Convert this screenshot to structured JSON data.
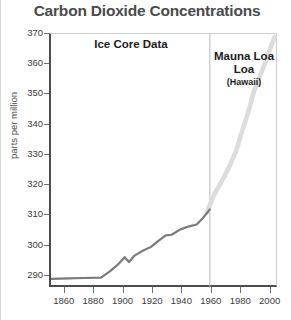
{
  "chart_data": {
    "type": "line",
    "title": "Carbon Dioxide Concentrations",
    "xlabel": "",
    "ylabel": "parts per million",
    "xlim": [
      1850,
      2005
    ],
    "ylim": [
      286,
      370
    ],
    "grid": false,
    "legend_position": "in-plot annotations",
    "xticks": [
      1860,
      1880,
      1900,
      1920,
      1940,
      1960,
      1980,
      2000
    ],
    "yticks": [
      290,
      300,
      310,
      320,
      330,
      340,
      350,
      360,
      370
    ],
    "annotations": [
      {
        "text": "Ice Core Data",
        "x": 1895,
        "y": 366
      },
      {
        "text": "Mauna Loa",
        "x": 1982,
        "y": 363
      },
      {
        "text": "Loa",
        "x": 1982,
        "y": 358
      },
      {
        "text": "(Hawaii)",
        "x": 1982,
        "y": 353
      }
    ],
    "divider_x": 1958,
    "series": [
      {
        "name": "Ice Core Data",
        "color": "#7a7a7a",
        "width": 2.2,
        "points": [
          [
            1850,
            289.0
          ],
          [
            1862,
            289.2
          ],
          [
            1872,
            289.3
          ],
          [
            1884,
            289.4
          ],
          [
            1890,
            291.5
          ],
          [
            1896,
            294.0
          ],
          [
            1900,
            296.2
          ],
          [
            1903,
            294.6
          ],
          [
            1907,
            296.8
          ],
          [
            1912,
            298.2
          ],
          [
            1918,
            299.6
          ],
          [
            1923,
            301.6
          ],
          [
            1928,
            303.4
          ],
          [
            1932,
            303.6
          ],
          [
            1938,
            305.4
          ],
          [
            1944,
            306.4
          ],
          [
            1949,
            307.0
          ],
          [
            1953,
            309.0
          ],
          [
            1958,
            312.0
          ]
        ]
      },
      {
        "name": "Mauna Loa (Hawaii)",
        "color": "#dcdcdc",
        "width": 4.6,
        "points": [
          [
            1956,
            311.0
          ],
          [
            1960,
            316.0
          ],
          [
            1964,
            319.5
          ],
          [
            1968,
            323.0
          ],
          [
            1972,
            327.0
          ],
          [
            1976,
            331.5
          ],
          [
            1980,
            338.0
          ],
          [
            1984,
            344.0
          ],
          [
            1988,
            351.0
          ],
          [
            1992,
            356.0
          ],
          [
            1996,
            361.0
          ],
          [
            2000,
            366.5
          ],
          [
            2002,
            369.0
          ]
        ]
      }
    ]
  }
}
